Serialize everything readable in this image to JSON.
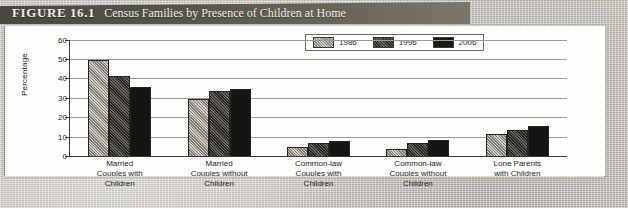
{
  "figure": {
    "number": "FIGURE 16.1",
    "title": "Census Families by Presence of Children at Home"
  },
  "chart_data": {
    "type": "bar",
    "title": "Census Families by Presence of Children at Home",
    "xlabel": "",
    "ylabel": "Percentage",
    "ylim": [
      0,
      60
    ],
    "yticks": [
      0,
      10,
      20,
      30,
      40,
      50,
      60
    ],
    "grid": true,
    "legend_position": "top-right",
    "categories": [
      "Married Couples with Children",
      "Married Couples without Children",
      "Common-law Couples with Children",
      "Common-law Couples without Children",
      "Lone Parents with Children"
    ],
    "category_lines": [
      [
        "Married",
        "Couples with",
        "Children"
      ],
      [
        "Married",
        "Couples without",
        "Children"
      ],
      [
        "Common-law",
        "Couples with",
        "Children"
      ],
      [
        "Common-law",
        "Couples without",
        "Children"
      ],
      [
        "Lone Parents",
        "with Children"
      ]
    ],
    "series": [
      {
        "name": "1986",
        "color": "#a6a29c",
        "values": [
          49,
          29,
          4,
          3,
          11
        ]
      },
      {
        "name": "1996",
        "color": "#474441",
        "values": [
          41,
          33,
          6,
          6,
          13
        ]
      },
      {
        "name": "2006",
        "color": "#161513",
        "values": [
          35,
          34,
          7,
          8,
          15
        ]
      }
    ]
  }
}
